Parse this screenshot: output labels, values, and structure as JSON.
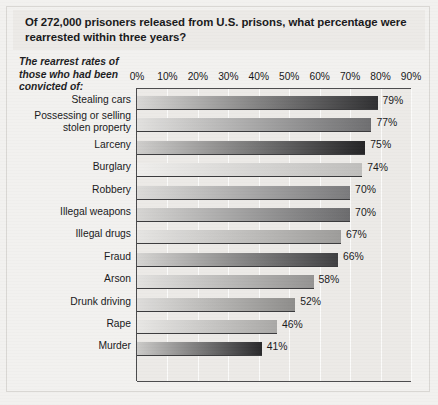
{
  "chart_data": {
    "type": "bar",
    "orientation": "horizontal",
    "title": "Of 272,000 prisoners released from U.S. prisons, what percentage were rearrested within three years?",
    "subtitle": "The rearrest rates of those who had been convicted of:",
    "xlabel": "",
    "ylabel": "",
    "xlim": [
      0,
      90
    ],
    "grid": true,
    "legend": false,
    "xticks": [
      "0%",
      "10%",
      "20%",
      "30%",
      "40%",
      "50%",
      "60%",
      "70%",
      "80%",
      "90%"
    ],
    "xtick_values": [
      0,
      10,
      20,
      30,
      40,
      50,
      60,
      70,
      80,
      90
    ],
    "categories": [
      "Stealing cars",
      "Possessing or selling\nstolen property",
      "Larceny",
      "Burglary",
      "Robbery",
      "Illegal weapons",
      "Illegal drugs",
      "Fraud",
      "Arson",
      "Drunk driving",
      "Rape",
      "Murder"
    ],
    "values": [
      79,
      77,
      75,
      74,
      70,
      70,
      67,
      66,
      58,
      52,
      46,
      41
    ],
    "value_labels": [
      "79%",
      "77%",
      "75%",
      "74%",
      "70%",
      "70%",
      "67%",
      "66%",
      "58%",
      "52%",
      "46%",
      "41%"
    ],
    "bar_gradients": [
      {
        "from": "#d8d7d5",
        "to": "#2f2f31"
      },
      {
        "from": "#e2e1df",
        "to": "#6e6e70"
      },
      {
        "from": "#cfcecc",
        "to": "#232325"
      },
      {
        "from": "#efeeec",
        "to": "#bfbebc"
      },
      {
        "from": "#dcdbd9",
        "to": "#7a7a7c"
      },
      {
        "from": "#d6d5d3",
        "to": "#6b6b6d"
      },
      {
        "from": "#e6e5e3",
        "to": "#9d9c9a"
      },
      {
        "from": "#d5d4d2",
        "to": "#3f3f41"
      },
      {
        "from": "#e3e2e0",
        "to": "#949392"
      },
      {
        "from": "#dedddb",
        "to": "#8e8d8b"
      },
      {
        "from": "#e8e7e5",
        "to": "#a9a8a6"
      },
      {
        "from": "#cbcac8",
        "to": "#29292b"
      }
    ]
  },
  "colors": {
    "page_background": "#f2f1ef",
    "panel_background": "#eceae7",
    "axis": "#4a4a4c",
    "gridline": "#fbfbfa",
    "text": "#18181a"
  }
}
